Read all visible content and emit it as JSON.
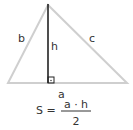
{
  "diagram": {
    "colors": {
      "triangle_edge": "#cfcfcf",
      "height_line": "#222222",
      "text": "#333333"
    },
    "labels": {
      "side_a": "a",
      "side_b": "b",
      "side_c": "c",
      "height": "h"
    },
    "formula": {
      "lhs": "S =",
      "numerator": "a · h",
      "denominator": "2"
    }
  }
}
